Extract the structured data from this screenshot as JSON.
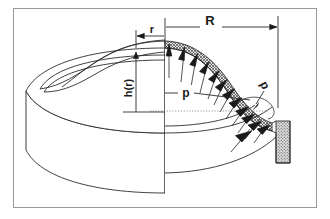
{
  "figure": {
    "kind": "technical-engineering-diagram",
    "background_color": "#ffffff",
    "line_color": "#2b2b2b",
    "frame": {
      "present": true,
      "color": "#9a9a9a",
      "x": 13,
      "y": 8,
      "width": 304,
      "height": 200
    },
    "labels": {
      "radius_outer": "R",
      "radius_local": "r",
      "height_function": "h(r)",
      "pressure": "p",
      "thickness": "d"
    },
    "dimension_lines": {
      "R": {
        "label": "R",
        "from_x": 165,
        "to_x": 278,
        "y": 27,
        "arrow_at": "right"
      },
      "r": {
        "label": "r",
        "from_x": 136,
        "to_x": 165,
        "y": 36,
        "arrow_at": "left"
      },
      "h": {
        "label": "h(r)",
        "x": 136,
        "from_y": 52,
        "to_y": 112,
        "arrow_at": "top",
        "orientation": "vertical"
      }
    },
    "pressure_arrows": {
      "label": "p",
      "count": 13,
      "direction": "outward-normal-to-shell",
      "fill": "#1a1a1a"
    },
    "shell": {
      "hatch_pattern": "cross-hatch",
      "hatch_color": "#555555",
      "wall_fill": "#d6d6d6"
    },
    "center_line": {
      "style": "dotted",
      "y": 111,
      "from_x": 150,
      "to_x": 268
    }
  }
}
